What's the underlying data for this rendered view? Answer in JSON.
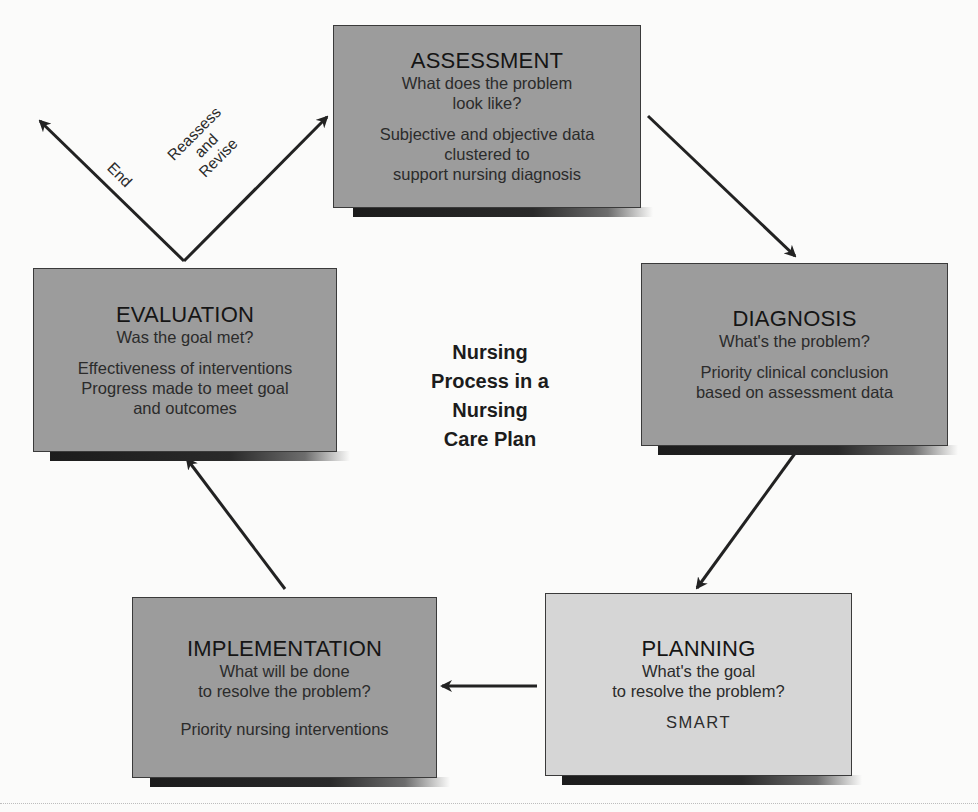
{
  "diagram": {
    "center_title": [
      "Nursing",
      "Process in a",
      "Nursing",
      "Care Plan"
    ],
    "steps": [
      {
        "id": "assessment",
        "title": "ASSESSMENT",
        "question": [
          "What does the problem",
          "look like?"
        ],
        "detail": [
          "Subjective and objective data",
          "clustered to",
          "support nursing diagnosis"
        ]
      },
      {
        "id": "diagnosis",
        "title": "DIAGNOSIS",
        "question": [
          "What's the problem?"
        ],
        "detail": [
          "Priority clinical conclusion",
          "based on assessment data"
        ]
      },
      {
        "id": "planning",
        "title": "PLANNING",
        "question": [
          "What's the goal",
          "to resolve the problem?"
        ],
        "detail": [
          "SMART"
        ]
      },
      {
        "id": "implementation",
        "title": "IMPLEMENTATION",
        "question": [
          "What will be done",
          "to resolve the problem?"
        ],
        "detail": [
          "Priority nursing interventions"
        ]
      },
      {
        "id": "evaluation",
        "title": "EVALUATION",
        "question": [
          "Was the goal met?"
        ],
        "detail": [
          "Effectiveness of interventions",
          "Progress made to meet goal",
          "and outcomes"
        ]
      }
    ],
    "branch_labels": {
      "end": "End",
      "reassess": [
        "Reassess",
        "and",
        "Revise"
      ]
    },
    "flow": [
      {
        "from": "assessment",
        "to": "diagnosis"
      },
      {
        "from": "diagnosis",
        "to": "planning"
      },
      {
        "from": "planning",
        "to": "implementation"
      },
      {
        "from": "implementation",
        "to": "evaluation"
      },
      {
        "from": "evaluation",
        "to": "end"
      },
      {
        "from": "evaluation",
        "to": "assessment"
      }
    ],
    "colors": {
      "box_dark": "#9c9c9c",
      "box_light": "#d6d6d6",
      "arrow": "#222222",
      "border": "#3a3a3a"
    }
  }
}
